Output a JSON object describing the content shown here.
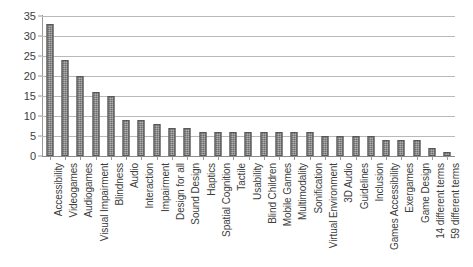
{
  "chart_data": {
    "type": "bar",
    "title": "",
    "subtitle": "",
    "xlabel": "",
    "ylabel": "",
    "ylim": [
      0,
      35
    ],
    "yticks": [
      0,
      5,
      10,
      15,
      20,
      25,
      30,
      35
    ],
    "grid": true,
    "legend": false,
    "legend_position": "none",
    "bar_color": "#6d6d6d",
    "categories": [
      "Accessibility",
      "Videogames",
      "Audiogames",
      "Visual Impairment",
      "Blindness",
      "Audio",
      "Interaction",
      "Impairment",
      "Design for all",
      "Sound Design",
      "Haptics",
      "Spatial Cognition",
      "Tactile",
      "Usability",
      "Blind Children",
      "Mobile Games",
      "Multimodality",
      "Sonification",
      "Virtual Environment",
      "3D Audio",
      "Guidelines",
      "Inclusion",
      "Games Accessibility",
      "Exergames",
      "Game Design",
      "14 different terms",
      "59 different terms"
    ],
    "values": [
      33,
      24,
      20,
      16,
      15,
      9,
      9,
      8,
      7,
      7,
      6,
      6,
      6,
      6,
      6,
      6,
      6,
      6,
      5,
      5,
      5,
      5,
      4,
      4,
      4,
      2,
      1
    ]
  }
}
